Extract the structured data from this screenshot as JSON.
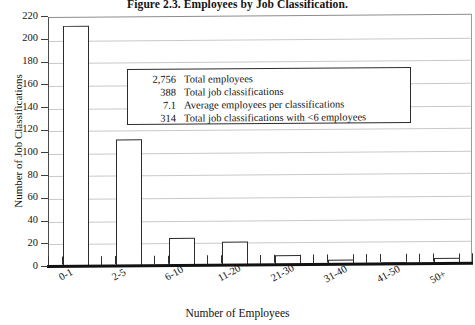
{
  "chart_data": {
    "type": "bar",
    "title": "Figure 2.3. Employees by Job Classification.",
    "xlabel": "Number of Employees",
    "ylabel": "Number of Job Classifications",
    "categories": [
      "0-1",
      "2-5",
      "6-10",
      "11-20",
      "21-30",
      "31-40",
      "41-50",
      "50+"
    ],
    "values": [
      213,
      112,
      25,
      21,
      9,
      4,
      2,
      5
    ],
    "ylim": [
      0,
      220
    ],
    "ytick_step": 20,
    "yticks": [
      0,
      20,
      40,
      60,
      80,
      100,
      120,
      140,
      160,
      180,
      200,
      220
    ],
    "grid": true,
    "legend": null,
    "bar_fill_color": "#ffffff",
    "bar_border_color": "#2b2b2b",
    "gridline_color": "#c9c9c9",
    "annotations": [
      {
        "value": "2,756",
        "text": "Total employees"
      },
      {
        "value": "388",
        "text": "Total job classifications"
      },
      {
        "value": "7.1",
        "text": "Average employees per classifications"
      },
      {
        "value": "314",
        "text": "Total job classifications with <6 employees"
      }
    ]
  }
}
